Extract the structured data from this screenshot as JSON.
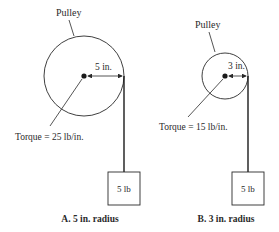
{
  "diagram": {
    "panels": [
      {
        "id": "A",
        "pulley_label": "Pulley",
        "radius_label": "5 in.",
        "torque_label": "Torque = 25 lb/in.",
        "weight_label": "5 lb",
        "caption": "A.  5 in. radius",
        "radius_in": 5,
        "weight_lb": 5,
        "torque_lb_in": 25
      },
      {
        "id": "B",
        "pulley_label": "Pulley",
        "radius_label": "3 in.",
        "torque_label": "Torque = 15 lb/in.",
        "weight_label": "5 lb",
        "caption": "B.  3 in. radius",
        "radius_in": 3,
        "weight_lb": 5,
        "torque_lb_in": 15
      }
    ],
    "colors": {
      "ink": "#2a2a2a",
      "background": "#ffffff"
    }
  }
}
